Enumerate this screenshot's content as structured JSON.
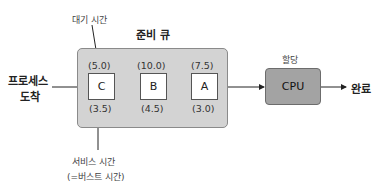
{
  "title": "준비 큐",
  "annotations": {
    "wait_time": "대기 시간",
    "service_time_line1": "서비스 시간",
    "service_time_line2": "(=버스트 시간)",
    "dispatch": "할당"
  },
  "arrival": {
    "line1": "프로세스",
    "line2": "도착"
  },
  "processes": [
    {
      "name": "C",
      "wait": "(5.0)",
      "burst": "(3.5)"
    },
    {
      "name": "B",
      "wait": "(10.0)",
      "burst": "(4.5)"
    },
    {
      "name": "A",
      "wait": "(7.5)",
      "burst": "(3.0)"
    }
  ],
  "cpu": {
    "label": "CPU"
  },
  "completion": "완료",
  "colors": {
    "queue_bg": "#d3d3d3",
    "cpu_bg": "#a3a3a3",
    "process_bg": "#ffffff"
  }
}
